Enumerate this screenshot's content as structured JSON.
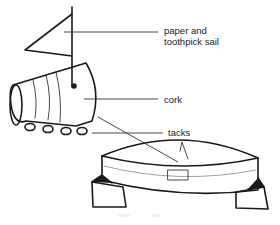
{
  "diagram": {
    "labels": {
      "sail": "paper and\ntoothpick sail",
      "sail_line1": "paper and",
      "sail_line2": "toothpick sail",
      "cork": "cork",
      "tacks": "tacks"
    },
    "components": [
      "paper and toothpick sail",
      "cork",
      "tacks",
      "boat in water tray"
    ],
    "colors": {
      "ink": "#1a1a1a",
      "leader": "#333333",
      "background": "#ffffff"
    }
  }
}
